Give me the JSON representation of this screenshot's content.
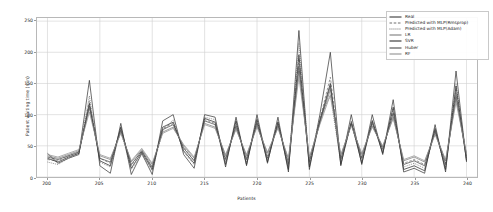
{
  "chart_data": {
    "type": "line",
    "title": "",
    "xlabel": "Patients",
    "ylabel": "Patient waiting time (min)",
    "xlim": [
      199,
      241
    ],
    "ylim": [
      0,
      255
    ],
    "yticks": [
      0,
      50,
      100,
      150,
      200,
      250
    ],
    "xticks": [
      200,
      205,
      210,
      215,
      220,
      225,
      230,
      235,
      240
    ],
    "grid": true,
    "legend_position": "upper right",
    "x": [
      200,
      201,
      202,
      203,
      204,
      205,
      206,
      207,
      208,
      209,
      210,
      211,
      212,
      213,
      214,
      215,
      216,
      217,
      218,
      219,
      220,
      221,
      222,
      223,
      224,
      225,
      226,
      227,
      228,
      229,
      230,
      231,
      232,
      233,
      234,
      235,
      236,
      237,
      238,
      239,
      240
    ],
    "series": [
      {
        "name": "Real",
        "style": "solid",
        "color": "#3a3a3a",
        "values": [
          38,
          22,
          30,
          36,
          155,
          18,
          6,
          86,
          4,
          38,
          4,
          90,
          100,
          36,
          14,
          100,
          96,
          16,
          96,
          18,
          100,
          22,
          96,
          8,
          235,
          12,
          100,
          200,
          18,
          100,
          20,
          100,
          36,
          124,
          8,
          14,
          6,
          84,
          8,
          170,
          24
        ]
      },
      {
        "name": "Predicted with MLP(Rmsprop)",
        "style": "dashed",
        "color": "#6e6e6e",
        "values": [
          28,
          26,
          34,
          40,
          122,
          30,
          22,
          78,
          18,
          42,
          14,
          78,
          86,
          48,
          26,
          92,
          86,
          30,
          84,
          30,
          88,
          34,
          86,
          22,
          190,
          26,
          92,
          160,
          30,
          90,
          32,
          88,
          46,
          104,
          22,
          28,
          20,
          76,
          22,
          140,
          34
        ]
      },
      {
        "name": "Predicted with MLP(Adam)",
        "style": "dotted",
        "color": "#585858",
        "values": [
          24,
          20,
          30,
          38,
          130,
          24,
          16,
          74,
          12,
          36,
          10,
          74,
          92,
          40,
          20,
          96,
          92,
          24,
          88,
          24,
          94,
          28,
          90,
          16,
          215,
          20,
          96,
          130,
          24,
          86,
          26,
          92,
          40,
          110,
          16,
          22,
          14,
          72,
          16,
          150,
          28
        ]
      },
      {
        "name": "LR",
        "style": "solid",
        "color": "#7c7c7c",
        "values": [
          34,
          30,
          36,
          42,
          110,
          34,
          28,
          72,
          24,
          44,
          20,
          72,
          80,
          50,
          30,
          86,
          80,
          34,
          78,
          34,
          82,
          38,
          80,
          28,
          170,
          30,
          86,
          140,
          34,
          84,
          36,
          82,
          48,
          96,
          26,
          32,
          24,
          70,
          26,
          126,
          36
        ]
      },
      {
        "name": "SVR",
        "style": "solid",
        "color": "#2f2f2f",
        "values": [
          30,
          24,
          32,
          38,
          118,
          26,
          18,
          80,
          14,
          40,
          12,
          80,
          88,
          42,
          22,
          94,
          88,
          20,
          90,
          20,
          92,
          24,
          88,
          12,
          196,
          16,
          90,
          150,
          20,
          88,
          22,
          90,
          38,
          112,
          12,
          18,
          10,
          78,
          12,
          146,
          26
        ]
      },
      {
        "name": "Huber",
        "style": "solid",
        "color": "#4a4a4a",
        "values": [
          32,
          28,
          34,
          40,
          114,
          30,
          24,
          76,
          20,
          42,
          16,
          76,
          84,
          46,
          26,
          90,
          84,
          28,
          82,
          28,
          86,
          30,
          84,
          20,
          178,
          24,
          88,
          146,
          28,
          86,
          30,
          86,
          44,
          102,
          20,
          26,
          18,
          74,
          20,
          132,
          30
        ]
      },
      {
        "name": "RF",
        "style": "solid",
        "color": "#909090",
        "values": [
          36,
          32,
          38,
          44,
          104,
          36,
          30,
          70,
          26,
          46,
          22,
          70,
          78,
          52,
          32,
          84,
          78,
          36,
          76,
          36,
          80,
          40,
          78,
          30,
          160,
          32,
          84,
          132,
          36,
          82,
          38,
          80,
          50,
          94,
          28,
          34,
          26,
          68,
          28,
          120,
          38
        ]
      }
    ]
  },
  "legend": {
    "items": [
      {
        "label": "Real"
      },
      {
        "label": "Predicted with MLP(Rmsprop)"
      },
      {
        "label": "Predicted with MLP(Adam)"
      },
      {
        "label": "LR"
      },
      {
        "label": "SVR"
      },
      {
        "label": "Huber"
      },
      {
        "label": "RF"
      }
    ]
  }
}
